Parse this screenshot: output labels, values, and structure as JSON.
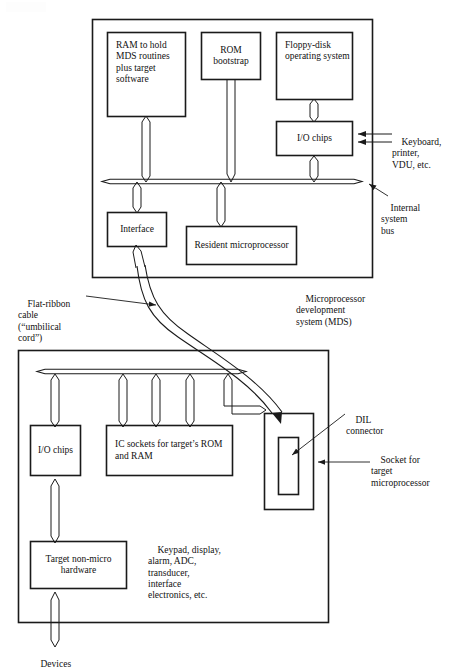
{
  "figure": {
    "type": "block-diagram"
  },
  "mds_panel": {
    "name": "Microprocessor development system",
    "caption_lines": [
      "Microprocessor",
      "development",
      "system (MDS)"
    ],
    "bus_label_lines": [
      "Internal",
      "system",
      "bus"
    ],
    "blocks": {
      "ram": {
        "lines": [
          "RAM to",
          "hold MDS",
          "routines",
          "plus",
          "target",
          "software"
        ]
      },
      "rom": {
        "lines": [
          "ROM",
          "bootstrap"
        ]
      },
      "fdos": {
        "lines": [
          "Floppy-disk",
          "operating",
          "system"
        ]
      },
      "io_chips": {
        "lines": [
          "I/O",
          "chips"
        ]
      },
      "interface": {
        "lines": [
          "Interface"
        ]
      },
      "resident_cpu": {
        "lines": [
          "Resident",
          "microprocessor"
        ]
      }
    },
    "peripherals_label_lines": [
      "Keyboard,",
      "printer,",
      "VDU, etc."
    ]
  },
  "cable": {
    "label_lines": [
      "Flat-ribbon",
      "cable",
      "(“umbilical",
      "cord”)"
    ]
  },
  "target_panel": {
    "name": "Target system",
    "blocks": {
      "io_chips": {
        "lines": [
          "I/O chips"
        ]
      },
      "ic_sockets": {
        "lines": [
          "IC sockets for",
          "target’s ROM and RAM"
        ]
      },
      "target_hw": {
        "lines": [
          "Target",
          "non-micro",
          "hardware"
        ]
      }
    },
    "dil_label_lines": [
      "DIL",
      "connector"
    ],
    "socket_label_lines": [
      "Socket for",
      "target",
      "microprocessor"
    ],
    "peripherals_label_lines": [
      "Keypad, display,",
      "alarm, ADC,",
      "transducer,",
      "interface",
      "electronics, etc."
    ],
    "devices_label": "Devices"
  },
  "colors": {
    "ink": "#111111",
    "line": "#1a1a1a",
    "paper": "#ffffff"
  }
}
